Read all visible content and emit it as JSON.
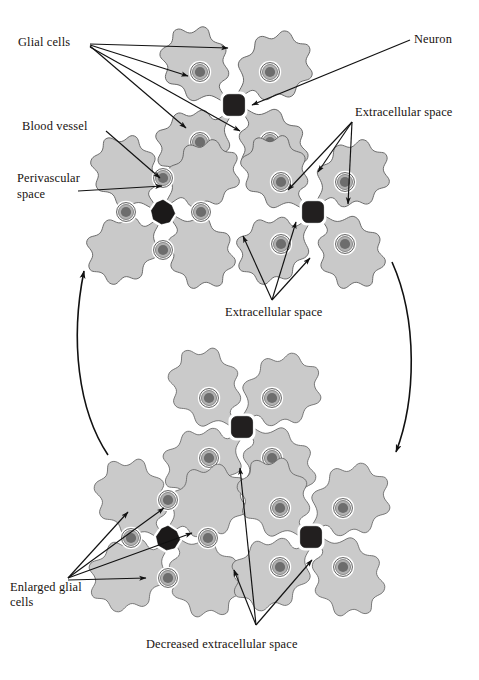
{
  "figure": {
    "background_color": "#ffffff"
  },
  "colors": {
    "cell_fill": "#c9c9c9",
    "cell_fill_light": "#d2d2d2",
    "cell_outline": "#5a5a5a",
    "nucleus_outer": "#ffffff",
    "nucleus_ring": "#a8a8a8",
    "nucleus_core": "#6d6d6d",
    "neuron_dark": "#221f1f",
    "vessel_dark": "#1b1919",
    "extracellular_space": "#ffffff",
    "label_text": "#17120f",
    "arrow": "#111111"
  },
  "labels": {
    "glial_cells": "Glial cells",
    "neuron": "Neuron",
    "blood_vessel": "Blood vessel",
    "perivascular_space_line1": "Perivascular",
    "perivascular_space_line2": "space",
    "extracellular_space_right": "Extracellular space",
    "extracellular_space_center": "Extracellular space",
    "enlarged_glial_cells_line1": "Enlarged glial",
    "enlarged_glial_cells_line2": "cells",
    "decreased_extracellular_space": "Decreased extracellular space"
  },
  "clusters": [
    {
      "id": "top-center",
      "name": "normal-glial-cluster-with-neuron",
      "center_type": "neuron",
      "cell_count": 4,
      "state": "normal"
    },
    {
      "id": "middle-left",
      "name": "normal-glial-cluster-with-blood-vessel",
      "center_type": "blood-vessel",
      "cell_count": 4,
      "state": "normal"
    },
    {
      "id": "middle-right",
      "name": "normal-glial-cluster-with-neuron",
      "center_type": "neuron",
      "cell_count": 4,
      "state": "normal"
    },
    {
      "id": "bottom-top",
      "name": "swollen-glial-cluster-with-neuron",
      "center_type": "neuron",
      "cell_count": 4,
      "state": "swollen"
    },
    {
      "id": "bottom-left",
      "name": "swollen-glial-cluster-with-blood-vessel",
      "center_type": "blood-vessel",
      "cell_count": 4,
      "state": "swollen"
    },
    {
      "id": "bottom-right",
      "name": "swollen-glial-cluster-with-neuron",
      "center_type": "neuron",
      "cell_count": 4,
      "state": "swollen"
    }
  ],
  "cycle_arrows": [
    {
      "name": "left-cycle-arrow",
      "direction": "upward",
      "meaning": "recovery from swelling"
    },
    {
      "name": "right-cycle-arrow",
      "direction": "downward",
      "meaning": "progression to swelling"
    }
  ]
}
